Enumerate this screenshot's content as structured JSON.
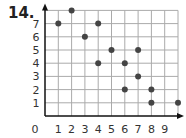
{
  "problem": {
    "number": "14."
  },
  "chart_data": {
    "type": "scatter",
    "title": "",
    "xlabel": "",
    "ylabel": "",
    "x_ticks": [
      "0",
      "1",
      "2",
      "3",
      "4",
      "5",
      "6",
      "7",
      "8",
      "9"
    ],
    "y_ticks": [
      "1",
      "2",
      "3",
      "4",
      "5",
      "6",
      "7"
    ],
    "xlim": [
      0,
      10
    ],
    "ylim": [
      0,
      8
    ],
    "grid": true,
    "points": [
      {
        "x": 1,
        "y": 7
      },
      {
        "x": 2,
        "y": 8
      },
      {
        "x": 3,
        "y": 6
      },
      {
        "x": 4,
        "y": 7
      },
      {
        "x": 4,
        "y": 4
      },
      {
        "x": 5,
        "y": 5
      },
      {
        "x": 6,
        "y": 4
      },
      {
        "x": 6,
        "y": 2
      },
      {
        "x": 7,
        "y": 5
      },
      {
        "x": 7,
        "y": 3
      },
      {
        "x": 8,
        "y": 2
      },
      {
        "x": 8,
        "y": 1
      },
      {
        "x": 10,
        "y": 1
      }
    ],
    "colors": {
      "point": "#444444",
      "grid": "#aaaaaa",
      "axis": "#111111"
    }
  }
}
